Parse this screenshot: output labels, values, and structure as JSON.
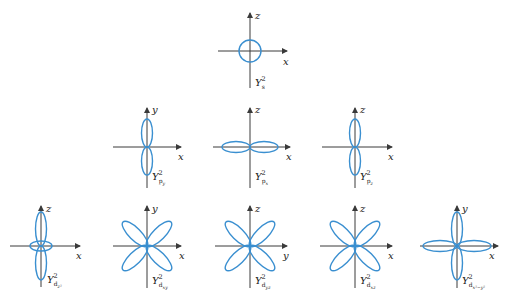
{
  "figure": {
    "colors": {
      "axis": "#3a3a3a",
      "lobe": "#3a8fd0",
      "text": "#222222"
    },
    "diagrams": [
      {
        "id": "s",
        "label": "Y",
        "sup": "2",
        "sub": "s",
        "subsub": "",
        "h_axis": "x",
        "v_axis": "z",
        "shape": "circle"
      },
      {
        "id": "py",
        "label": "Y",
        "sup": "2",
        "sub": "p",
        "subsub": "y",
        "h_axis": "x",
        "v_axis": "y",
        "shape": "vertical-dumbbell"
      },
      {
        "id": "px",
        "label": "Y",
        "sup": "2",
        "sub": "p",
        "subsub": "x",
        "h_axis": "x",
        "v_axis": "z",
        "shape": "horizontal-dumbbell"
      },
      {
        "id": "pz",
        "label": "Y",
        "sup": "2",
        "sub": "p",
        "subsub": "z",
        "h_axis": "x",
        "v_axis": "z",
        "shape": "vertical-dumbbell"
      },
      {
        "id": "dz2",
        "label": "Y",
        "sup": "2",
        "sub": "d",
        "subsub": "z²",
        "h_axis": "x",
        "v_axis": "z",
        "shape": "dumbbell-with-torus"
      },
      {
        "id": "dxy",
        "label": "Y",
        "sup": "2",
        "sub": "d",
        "subsub": "xy",
        "h_axis": "x",
        "v_axis": "y",
        "shape": "four-leaf-diagonal"
      },
      {
        "id": "dyz",
        "label": "Y",
        "sup": "2",
        "sub": "d",
        "subsub": "yz",
        "h_axis": "y",
        "v_axis": "z",
        "shape": "four-leaf-diagonal"
      },
      {
        "id": "dxz",
        "label": "Y",
        "sup": "2",
        "sub": "d",
        "subsub": "xz",
        "h_axis": "x",
        "v_axis": "z",
        "shape": "four-leaf-diagonal"
      },
      {
        "id": "dx2y2",
        "label": "Y",
        "sup": "2",
        "sub": "d",
        "subsub": "x²−y²",
        "h_axis": "x",
        "v_axis": "y",
        "shape": "four-leaf-axial"
      }
    ]
  }
}
